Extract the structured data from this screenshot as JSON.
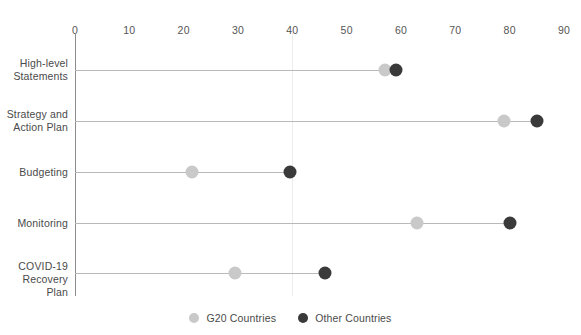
{
  "chart_data": {
    "type": "scatter",
    "subtype": "dumbbell",
    "title": "",
    "xlabel": "",
    "ylabel": "",
    "xlim": [
      0,
      90
    ],
    "xticks": [
      0,
      10,
      20,
      30,
      40,
      50,
      60,
      70,
      80,
      90
    ],
    "xtick_labels": [
      "0",
      "10",
      "20",
      "30",
      "40",
      "50",
      "60",
      "70",
      "80",
      "90"
    ],
    "grid": "vertical-faint",
    "legend_position": "bottom-center",
    "categories": [
      "High-level\nStatements",
      "Strategy and\nAction Plan",
      "Budgeting",
      "Monitoring",
      "COVID-19\nRecovery Plan"
    ],
    "series": [
      {
        "name": "G20 Countries",
        "color": "#c9c9c9",
        "values": [
          57,
          79,
          21.5,
          63,
          29.5
        ]
      },
      {
        "name": "Other Countries",
        "color": "#3a3a3a",
        "values": [
          59,
          85,
          39.5,
          80,
          46
        ]
      }
    ],
    "legend": [
      {
        "label": "G20 Countries",
        "color": "#c9c9c9"
      },
      {
        "label": "Other Countries",
        "color": "#3a3a3a"
      }
    ]
  },
  "axis": {
    "ticks": [
      {
        "label": "0"
      },
      {
        "label": "10"
      },
      {
        "label": "20"
      },
      {
        "label": "30"
      },
      {
        "label": "40"
      },
      {
        "label": "50"
      },
      {
        "label": "60"
      },
      {
        "label": "70"
      },
      {
        "label": "80"
      },
      {
        "label": "90"
      }
    ]
  },
  "rows": [
    {
      "label": "High-level\nStatements"
    },
    {
      "label": "Strategy and\nAction Plan"
    },
    {
      "label": "Budgeting"
    },
    {
      "label": "Monitoring"
    },
    {
      "label": "COVID-19\nRecovery Plan"
    }
  ],
  "legend": {
    "items": [
      {
        "label": "G20 Countries"
      },
      {
        "label": "Other Countries"
      }
    ]
  }
}
